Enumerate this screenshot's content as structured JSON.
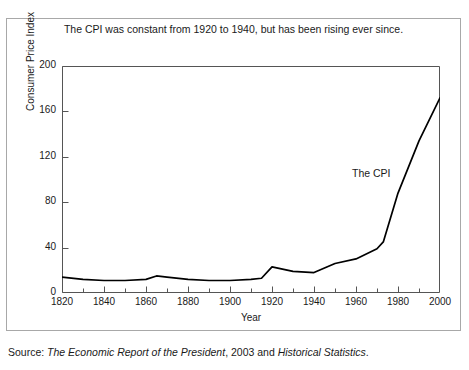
{
  "chart_data": {
    "type": "line",
    "title": "The CPI was constant from 1920 to 1940, but has been rising ever since.",
    "xlabel": "Year",
    "ylabel": "Consumer Price Index",
    "xlim": [
      1820,
      2000
    ],
    "ylim": [
      0,
      200
    ],
    "xticks": [
      1820,
      1840,
      1860,
      1880,
      1900,
      1920,
      1940,
      1960,
      1980,
      2000
    ],
    "xtick_labels": [
      "1820",
      "1840",
      "1860",
      "1880",
      "1900",
      "1920",
      "1940",
      "1960",
      "1980",
      "2000"
    ],
    "xminor_tick_step": 10,
    "yticks": [
      0,
      40,
      80,
      120,
      160,
      200
    ],
    "ytick_labels": [
      "0",
      "40",
      "80",
      "120",
      "160",
      "200"
    ],
    "grid": false,
    "legend": "none",
    "annotations": [
      {
        "text": "The CPI",
        "x": 1962,
        "y": 88
      }
    ],
    "series": [
      {
        "name": "The CPI",
        "color": "#000000",
        "x": [
          1820,
          1830,
          1840,
          1850,
          1860,
          1865,
          1870,
          1880,
          1890,
          1900,
          1910,
          1915,
          1920,
          1930,
          1940,
          1950,
          1960,
          1970,
          1973,
          1980,
          1990,
          2000
        ],
        "values": [
          14,
          12,
          11,
          11,
          12,
          15,
          14,
          12,
          11,
          11,
          12,
          13,
          23,
          19,
          18,
          26,
          30,
          39,
          45,
          88,
          134,
          172
        ]
      }
    ]
  },
  "source": {
    "prefix": "Source: ",
    "italic_1": "The Economic Report of the President",
    "middle": ", 2003 and ",
    "italic_2": "Historical Statistics",
    "suffix": "."
  }
}
